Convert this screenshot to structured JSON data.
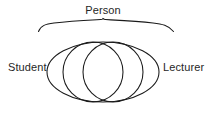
{
  "diagram": {
    "type": "venn-diagram",
    "title": "Person",
    "background_color": "#ffffff",
    "stroke_color": "#1a1a1a",
    "labels": {
      "top": "Person",
      "left": "Student",
      "right": "Lecturer"
    },
    "sets": [
      {
        "name": "Person",
        "role": "universe",
        "shape": "ellipse"
      },
      {
        "name": "Student",
        "role": "subset",
        "shape": "circle"
      },
      {
        "name": "Lecturer",
        "role": "subset",
        "shape": "circle"
      }
    ],
    "brace": {
      "name": "person-brace",
      "orientation": "top",
      "spans": "Person"
    }
  }
}
